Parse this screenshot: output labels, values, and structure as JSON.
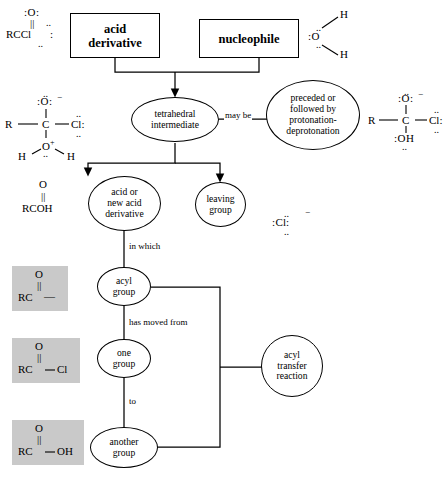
{
  "diagram": {
    "boxes": [
      {
        "id": "acid-derivative",
        "label": "acid\nderivative"
      },
      {
        "id": "nucleophile",
        "label": "nucleophile"
      }
    ],
    "ellipses": [
      {
        "id": "tetrahedral-intermediate",
        "label": "tetrahedral\nintermediate"
      },
      {
        "id": "protonation-deprotonation",
        "label": "preceded or\nfollowed by\nprotonation-\ndeprotonation"
      },
      {
        "id": "acid-or-new-acid-derivative",
        "label": "acid or\nnew acid\nderivative"
      },
      {
        "id": "leaving-group",
        "label": "leaving\ngroup"
      },
      {
        "id": "acyl-group",
        "label": "acyl\ngroup"
      },
      {
        "id": "one-group",
        "label": "one\ngroup"
      },
      {
        "id": "another-group",
        "label": "another\ngroup"
      },
      {
        "id": "acyl-transfer-reaction",
        "label": "acyl\ntransfer\nreaction"
      }
    ],
    "edge_labels": [
      {
        "id": "may-be",
        "label": "may be"
      },
      {
        "id": "in-which",
        "label": "in which"
      },
      {
        "id": "has-moved-from",
        "label": "has moved from"
      },
      {
        "id": "to",
        "label": "to"
      }
    ]
  },
  "structures": {
    "acid_chloride": {
      "id": "acid-chloride-structure",
      "top": ":O:",
      "bond": "||",
      "body": "RCCl",
      "lone_above": "..",
      "lone_below": ".."
    },
    "water": {
      "id": "water-structure",
      "center": "O",
      "h_top": "H",
      "h_bottom": "H"
    },
    "tetrahedral_left": {
      "id": "tetrahedral-intermediate-structure-left",
      "o_top": ":O:",
      "charge_top": "−",
      "r": "R",
      "c": "C",
      "cl": "Cl",
      "o_bottom": "O",
      "charge_bottom": "+",
      "h_left": "H",
      "h_right": "H"
    },
    "tetrahedral_right": {
      "id": "tetrahedral-intermediate-structure-right",
      "o_top": ":O:",
      "charge_top": "−",
      "r": "R",
      "c": "C",
      "cl": "Cl",
      "oh": ":OH"
    },
    "carboxylic_acid": {
      "id": "carboxylic-acid-structure",
      "top": "O",
      "bond": "||",
      "body": "RCOH"
    },
    "chloride_ion": {
      "id": "chloride-ion-structure",
      "label": "Cl",
      "charge": "−"
    },
    "acyl_generic": {
      "id": "acyl-group-structure",
      "top": "O",
      "bond": "||",
      "body": "RC",
      "tail": "—"
    },
    "acyl_chloride": {
      "id": "acyl-chloride-structure",
      "top": "O",
      "bond": "||",
      "body": "RC",
      "tail": "Cl"
    },
    "acyl_hydroxy": {
      "id": "carboxylic-acid-boxed-structure",
      "top": "O",
      "bond": "||",
      "body": "RC",
      "tail": "OH"
    }
  },
  "colors": {
    "stroke": "#000000",
    "background": "#ffffff",
    "highlight": "#c9c9c9"
  }
}
